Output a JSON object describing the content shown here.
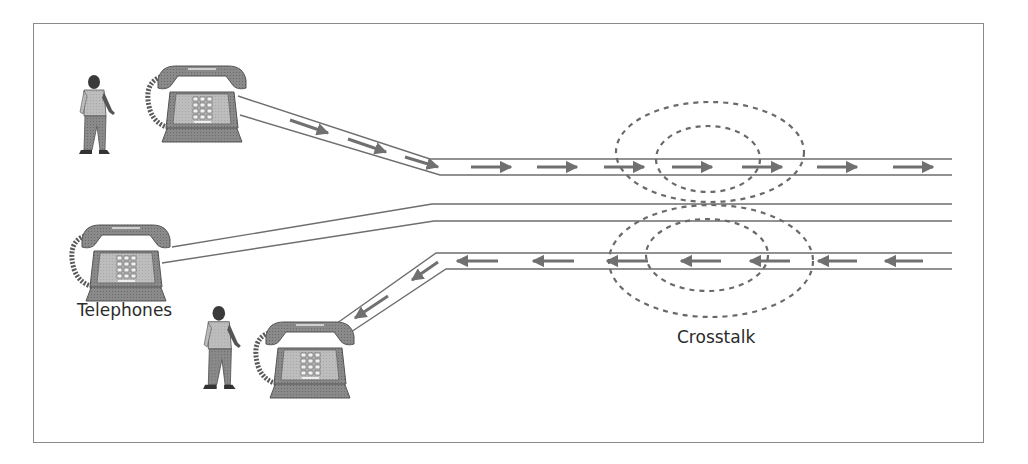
{
  "diagram": {
    "labels": {
      "telephones": "Telephones",
      "crosstalk": "Crosstalk"
    },
    "colors": {
      "line": "#6e6e6e",
      "arrow": "#707070",
      "dash": "#6a6a6a",
      "phone_body": "#7a7a7a",
      "phone_face": "#b9b9b9",
      "frame": "#8a8a8a",
      "text": "#2b2b2b"
    },
    "elements": {
      "callers": [
        {
          "id": "caller-top",
          "role": "person talking on top telephone"
        },
        {
          "id": "caller-bottom",
          "role": "person talking on bottom telephone"
        }
      ],
      "telephones": [
        {
          "id": "phone-top",
          "signal_direction": "outgoing (right)"
        },
        {
          "id": "phone-middle",
          "signal_direction": "idle line"
        },
        {
          "id": "phone-bottom",
          "signal_direction": "incoming (left)"
        }
      ],
      "line_pairs": [
        {
          "id": "pair-top",
          "y": [
            159,
            175
          ],
          "arrow_direction": "right",
          "arrow_count": 10
        },
        {
          "id": "pair-middle",
          "y": [
            204,
            221
          ],
          "arrow_direction": "none",
          "arrow_count": 0
        },
        {
          "id": "pair-bottom",
          "y": [
            253,
            269
          ],
          "arrow_direction": "left",
          "arrow_count": 9
        }
      ],
      "interference_fields": [
        {
          "id": "field-top",
          "rings": 2,
          "center_x": 713
        },
        {
          "id": "field-bottom",
          "rings": 2,
          "center_x": 713
        }
      ]
    }
  }
}
